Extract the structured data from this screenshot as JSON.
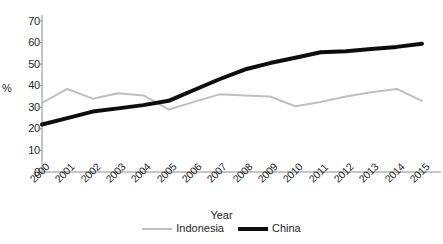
{
  "chart_data": {
    "type": "line",
    "title": "",
    "xlabel": "Year",
    "ylabel": "%",
    "categories": [
      "2000",
      "2001",
      "2002",
      "2003",
      "2004",
      "2005",
      "2006",
      "2007",
      "2008",
      "2009",
      "2010",
      "2011",
      "2012",
      "2013",
      "2014",
      "2015"
    ],
    "x": [
      2000,
      2001,
      2002,
      2003,
      2004,
      2005,
      2006,
      2007,
      2008,
      2009,
      2010,
      2011,
      2012,
      2013,
      2014,
      2015
    ],
    "series": [
      {
        "name": "Indonesia",
        "color": "#bfbfbf",
        "line_width": 2,
        "values": [
          32,
          38.5,
          34,
          36.5,
          35.5,
          29,
          32.5,
          36,
          35.5,
          35,
          30.5,
          32.5,
          35,
          37,
          38.5,
          33
        ]
      },
      {
        "name": "China",
        "color": "#0d0d0d",
        "line_width": 4,
        "values": [
          22,
          25,
          28,
          29.5,
          31,
          33,
          38,
          43,
          47.5,
          50.5,
          53,
          55.5,
          56,
          57,
          58,
          59.5
        ]
      }
    ],
    "ylim": [
      0,
      70
    ],
    "ytick_values": [
      0,
      10,
      20,
      30,
      40,
      50,
      60,
      70
    ],
    "ytick_labels": [
      "0",
      "10",
      "20",
      "30",
      "40",
      "50",
      "60",
      "70"
    ],
    "xtick_rotation": -45,
    "grid": false,
    "legend_position": "bottom",
    "axis_color": "#8c8c8c"
  },
  "legend": {
    "items": [
      {
        "label": "Indonesia"
      },
      {
        "label": "China"
      }
    ]
  },
  "axes": {
    "y_title": "%",
    "x_title": "Year"
  }
}
